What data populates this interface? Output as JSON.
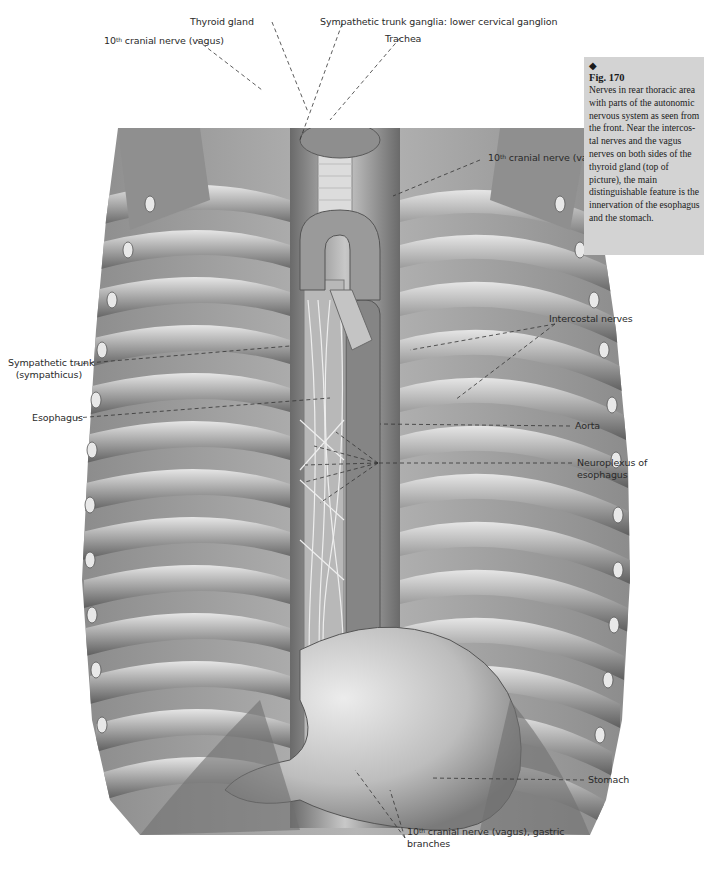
{
  "caption": {
    "marker": "◆",
    "figure_number": "Fig. 170",
    "text": "Nerves in rear thoracic area with parts of the autonomic nervous system as seen from the front. Near the intercos-tal nerves and the vagus nerves on both sides of the thyroid gland (top of picture), the main distinguishable feature is the innervation of the esophagus and the stomach.",
    "background": "#d3d3d3"
  },
  "labels": {
    "thyroid_gland": "Thyroid gland",
    "sympathetic_ganglia": "Sympathetic trunk ganglia: lower cervical ganglion",
    "trachea": "Trachea",
    "vagus_left_pre": "10",
    "vagus_left_sup": "th",
    "vagus_left_post": " cranial nerve (vagus)",
    "vagus_right_pre": "10",
    "vagus_right_sup": "th",
    "vagus_right_post": " cranial nerve (vagus)",
    "intercostal_nerves": "Intercostal nerves",
    "sympathetic_trunk_line1": "Sympathetic trunk",
    "sympathetic_trunk_line2": "(sympathicus)",
    "esophagus": "Esophagus",
    "aorta": "Aorta",
    "neuroplexus_line1": "Neuroplexus of",
    "neuroplexus_line2": "esophagus",
    "stomach": "Stomach",
    "gastric_pre": "10",
    "gastric_sup": "th",
    "gastric_post": " cranial nerve (vagus), gastric",
    "gastric_line2": "branches"
  },
  "colors": {
    "illustration_dark": "#5a5a5a",
    "illustration_mid": "#9a9a9a",
    "illustration_light": "#d8d8d8",
    "leader_line": "#333333"
  }
}
